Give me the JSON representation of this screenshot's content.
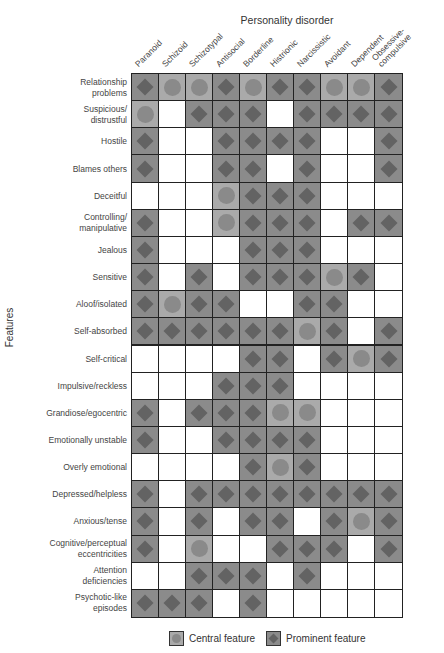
{
  "chart_data": {
    "type": "table",
    "title": "Personality disorder",
    "xlabel": "Personality disorder",
    "ylabel": "Features",
    "columns": [
      "Paranoid",
      "Schizoid",
      "Schizotypal",
      "Antisocial",
      "Borderline",
      "Histrionic",
      "Narcissistic",
      "Avoidant",
      "Dependent",
      "Obsessive-compulsive"
    ],
    "column_labels": [
      {
        "lines": [
          "Paranoid"
        ]
      },
      {
        "lines": [
          "Schizoid"
        ]
      },
      {
        "lines": [
          "Schizotypal"
        ]
      },
      {
        "lines": [
          "Antisocial"
        ]
      },
      {
        "lines": [
          "Borderline"
        ]
      },
      {
        "lines": [
          "Histrionic"
        ]
      },
      {
        "lines": [
          "Narcissistic"
        ]
      },
      {
        "lines": [
          "Avoidant"
        ]
      },
      {
        "lines": [
          "Dependent"
        ]
      },
      {
        "lines": [
          "Obsessive-",
          "compulsive"
        ]
      }
    ],
    "legend": [
      {
        "key": "C",
        "label": "Central feature",
        "marker": "circle"
      },
      {
        "key": "D",
        "label": "Prominent feature",
        "marker": "diamond"
      }
    ],
    "rows": [
      {
        "feature": "Relationship problems",
        "lines": [
          "Relationship",
          "problems"
        ],
        "values": [
          "D",
          "C",
          "C",
          "D",
          "C",
          "D",
          "D",
          "C",
          "C",
          "D"
        ]
      },
      {
        "feature": "Suspicious/distrustful",
        "lines": [
          "Suspicious/",
          "distrustful"
        ],
        "values": [
          "C",
          "",
          "D",
          "D",
          "D",
          "",
          "D",
          "D",
          "D",
          "D"
        ]
      },
      {
        "feature": "Hostile",
        "lines": [
          "Hostile"
        ],
        "values": [
          "D",
          "",
          "",
          "D",
          "D",
          "D",
          "D",
          "",
          "",
          "D"
        ]
      },
      {
        "feature": "Blames others",
        "lines": [
          "Blames others"
        ],
        "values": [
          "D",
          "",
          "",
          "D",
          "D",
          "",
          "D",
          "",
          "",
          "D"
        ]
      },
      {
        "feature": "Deceitful",
        "lines": [
          "Deceitful"
        ],
        "values": [
          "",
          "",
          "",
          "C",
          "D",
          "D",
          "D",
          "",
          "",
          ""
        ]
      },
      {
        "feature": "Controlling/manipulative",
        "lines": [
          "Controlling/",
          "manipulative"
        ],
        "values": [
          "D",
          "",
          "",
          "C",
          "D",
          "D",
          "D",
          "",
          "D",
          "D"
        ]
      },
      {
        "feature": "Jealous",
        "lines": [
          "Jealous"
        ],
        "values": [
          "D",
          "",
          "",
          "",
          "D",
          "D",
          "D",
          "",
          "",
          ""
        ]
      },
      {
        "feature": "Sensitive",
        "lines": [
          "Sensitive"
        ],
        "values": [
          "D",
          "",
          "D",
          "",
          "D",
          "D",
          "D",
          "C",
          "D",
          ""
        ]
      },
      {
        "feature": "Aloof/isolated",
        "lines": [
          "Aloof/isolated"
        ],
        "values": [
          "D",
          "C",
          "D",
          "D",
          "",
          "",
          "D",
          "D",
          "",
          ""
        ]
      },
      {
        "feature": "Self-absorbed",
        "lines": [
          "Self-absorbed"
        ],
        "values": [
          "D",
          "D",
          "D",
          "D",
          "D",
          "D",
          "C",
          "D",
          "",
          "D"
        ]
      },
      {
        "feature": "Self-critical",
        "lines": [
          "Self-critical"
        ],
        "values": [
          "",
          "",
          "",
          "",
          "D",
          "D",
          "",
          "D",
          "C",
          "D"
        ]
      },
      {
        "feature": "Impulsive/reckless",
        "lines": [
          "Impulsive/reckless"
        ],
        "values": [
          "",
          "",
          "",
          "D",
          "D",
          "D",
          "",
          "",
          "",
          ""
        ]
      },
      {
        "feature": "Grandiose/egocentric",
        "lines": [
          "Grandiose/egocentric"
        ],
        "values": [
          "D",
          "",
          "D",
          "D",
          "D",
          "C",
          "C",
          "",
          "",
          ""
        ]
      },
      {
        "feature": "Emotionally unstable",
        "lines": [
          "Emotionally unstable"
        ],
        "values": [
          "D",
          "",
          "",
          "D",
          "D",
          "D",
          "D",
          "",
          "",
          ""
        ]
      },
      {
        "feature": "Overly emotional",
        "lines": [
          "Overly emotional"
        ],
        "values": [
          "",
          "",
          "",
          "",
          "D",
          "C",
          "D",
          "",
          "",
          ""
        ]
      },
      {
        "feature": "Depressed/helpless",
        "lines": [
          "Depressed/helpless"
        ],
        "values": [
          "D",
          "",
          "D",
          "D",
          "D",
          "D",
          "D",
          "D",
          "D",
          "D"
        ]
      },
      {
        "feature": "Anxious/tense",
        "lines": [
          "Anxious/tense"
        ],
        "values": [
          "D",
          "",
          "D",
          "",
          "D",
          "D",
          "",
          "D",
          "C",
          "D"
        ]
      },
      {
        "feature": "Cognitive/perceptual eccentricities",
        "lines": [
          "Cognitive/perceptual",
          "eccentricities"
        ],
        "values": [
          "D",
          "",
          "C",
          "",
          "",
          "D",
          "D",
          "D",
          "",
          "D"
        ]
      },
      {
        "feature": "Attention deficiencies",
        "lines": [
          "Attention",
          "deficiencies"
        ],
        "values": [
          "",
          "",
          "D",
          "D",
          "D",
          "",
          "D",
          "",
          "",
          ""
        ]
      },
      {
        "feature": "Psychotic-like episodes",
        "lines": [
          "Psychotic-like",
          "episodes"
        ],
        "values": [
          "D",
          "D",
          "D",
          "",
          "D",
          "",
          "",
          "",
          "",
          ""
        ]
      }
    ],
    "colors": {
      "central_bg": "#aaaaaa",
      "central_marker": "#8a8a8a",
      "prominent_bg": "#8b8b8b",
      "prominent_marker": "#636363",
      "empty_bg": "#ffffff",
      "grid_line": "#222222"
    }
  },
  "header": {
    "title": "Personality disorder"
  },
  "axis": {
    "y_label": "Features"
  },
  "legend": {
    "central_label": "Central feature",
    "prominent_label": "Prominent feature"
  }
}
